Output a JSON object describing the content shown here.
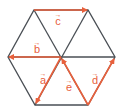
{
  "diagram": {
    "shape": "regular-hexagon",
    "colors": {
      "edge": "#4a4f55",
      "vector": "#e8603c",
      "background": "#ffffff"
    },
    "vertices": {
      "top_left": [
        34,
        10
      ],
      "top_right": [
        88,
        10
      ],
      "right": [
        115,
        57
      ],
      "bottom_right": [
        88,
        105
      ],
      "bottom_left": [
        35,
        105
      ],
      "left": [
        8,
        57
      ],
      "center": [
        61,
        57
      ]
    },
    "vectors": [
      {
        "name": "a",
        "label": "a",
        "arrow": "→",
        "from": "center",
        "to": "bottom_left"
      },
      {
        "name": "b",
        "label": "b",
        "arrow": "→",
        "from": "center",
        "to": "left"
      },
      {
        "name": "c",
        "label": "c",
        "arrow": "→",
        "from": "top_left",
        "to": "top_right"
      },
      {
        "name": "d",
        "label": "d",
        "arrow": "→",
        "from": "bottom_right",
        "to": "right"
      },
      {
        "name": "e",
        "label": "e",
        "arrow": "→",
        "from": "bottom_right",
        "to": "center"
      }
    ]
  }
}
